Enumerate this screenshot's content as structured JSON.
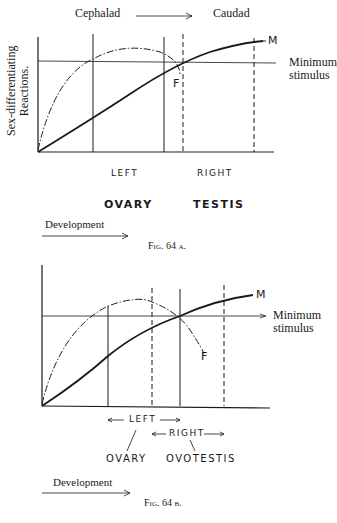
{
  "fig_a": {
    "header_left": "Cephalad",
    "header_right": "Caudad",
    "y_axis_label_line1": "Sex-differentiating",
    "y_axis_label_line2": "Reactions.",
    "threshold_label_line1": "Minimum",
    "threshold_label_line2": "stimulus",
    "curve_m_label": "M",
    "curve_f_label": "F",
    "region_left": "LEFT",
    "region_right": "RIGHT",
    "organ_left": "OVARY",
    "organ_right": "TESTIS",
    "development_label": "Development",
    "caption": "Fig. 64 a."
  },
  "fig_b": {
    "threshold_label_line1": "Minimum",
    "threshold_label_line2": "stimulus",
    "curve_m_label": "M",
    "curve_f_label": "F",
    "region_left": "LEFT",
    "region_right": "RIGHT",
    "organ_left": "OVARY",
    "organ_right": "OVOTESTIS",
    "development_label": "Development",
    "caption": "Fig. 64 b."
  },
  "colors": {
    "ink": "#1a1a1a",
    "paper": "#ffffff"
  }
}
